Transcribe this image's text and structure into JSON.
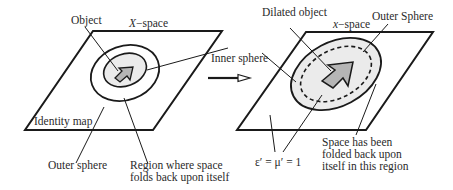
{
  "figure": {
    "left_panel": {
      "space_label_var": "X",
      "space_label_suffix": "−space",
      "object_label": "Object",
      "inner_sphere_label": "Inner sphere",
      "identity_map_label": "Identity map",
      "outer_sphere_label": "Outer sphere",
      "region_label_line1": "Region where space",
      "region_label_line2": "folds back upon itself"
    },
    "right_panel": {
      "dilated_object_label": "Dilated object",
      "space_label_var": "x",
      "space_label_suffix": "−space",
      "outer_sphere_label": "Outer Sphere",
      "material_label": "ε′ = μ′ = 1",
      "folded_label_line1": "Space has been",
      "folded_label_line2": "folded back upon",
      "folded_label_line3": "itself in this region"
    },
    "colors": {
      "stroke": "#1a1a1a",
      "region_fill": "#ebebeb",
      "object_fill": "#b5b5b5"
    }
  }
}
